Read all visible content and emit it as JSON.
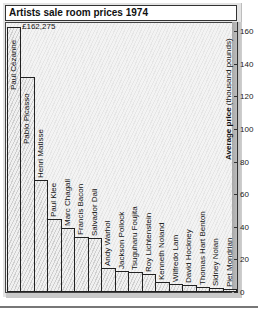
{
  "chart_data": {
    "type": "bar",
    "title": "Artists sale room prices 1974",
    "xlabel": "",
    "ylabel": "Average price (thousand pounds)",
    "ylabel_bold": "Average price",
    "ylabel_rest": " (thousand pounds)",
    "ylim": [
      0,
      165
    ],
    "yticks": [
      0,
      20,
      40,
      60,
      80,
      100,
      120,
      140,
      160
    ],
    "y_axis_position": "right",
    "grid": false,
    "annotation": "£162,275",
    "categories": [
      "Paul Cézanne",
      "Pablo Picasso",
      "Henri Matisse",
      "Paul Klee",
      "Marc Chagall",
      "Francis Bacon",
      "Salvador Dali",
      "Andy Warhol",
      "Jackson Pollock",
      "Tsuguharu Foujita",
      "Roy Lichtenstein",
      "Kenneth Noland",
      "Wilfredo Lam",
      "David Hockney",
      "Thomas Hart Benton",
      "Sidney Nolan",
      "Piet Mondrian"
    ],
    "values": [
      162.275,
      132,
      69,
      45,
      39,
      34,
      33,
      15,
      13,
      12,
      11,
      6,
      5,
      4,
      3,
      2.5,
      2
    ]
  }
}
